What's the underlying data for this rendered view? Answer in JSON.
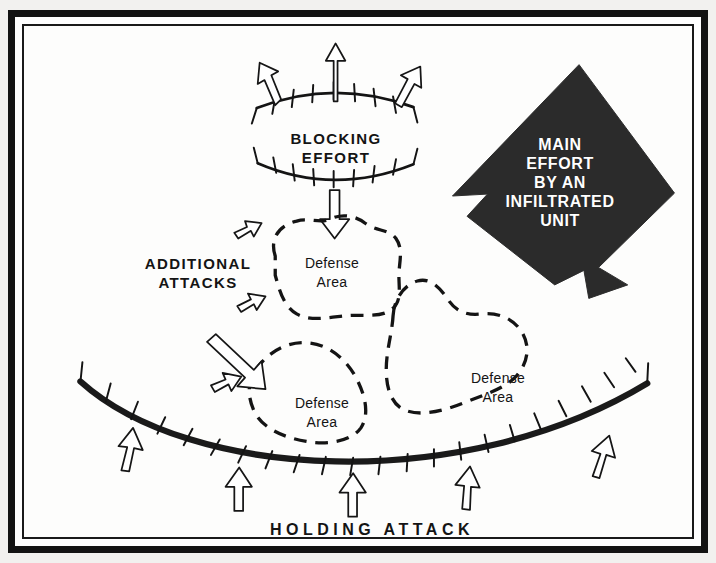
{
  "figure": {
    "type": "military-tactical-diagram",
    "background_color": "#ffffff",
    "frame_color": "#131313"
  },
  "labels": {
    "blocking_effort": "BLOCKING\nEFFORT",
    "additional_attacks": "ADDITIONAL\nATTACKS",
    "holding_attack": "HOLDING  ATTACK",
    "main_effort": "MAIN\nEFFORT\nBY AN\nINFILTRATED\nUNIT"
  },
  "defense_areas": [
    {
      "id": "top",
      "label": "Defense\nArea"
    },
    {
      "id": "lower-left",
      "label": "Defense\nArea"
    },
    {
      "id": "right",
      "label": "Defense\nArea"
    }
  ],
  "elements": {
    "blocking_line_upper": "curved-line-with-ticks",
    "blocking_line_lower": "curved-line-with-ticks",
    "holding_attack_line": "thick-curved-line-with-ticks",
    "main_effort_arrow": "large-filled-black-arrow",
    "outline_arrows": "hollow-attack-arrows"
  },
  "colors": {
    "ink": "#141414",
    "arrow_fill": "#2b2b2b",
    "paper": "#fdfdfc"
  }
}
